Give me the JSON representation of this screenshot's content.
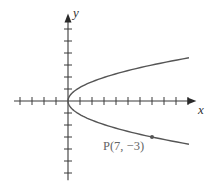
{
  "chart_data": {
    "type": "line",
    "title": "",
    "xlabel": "x",
    "ylabel": "y",
    "equation": "x = (7/9) y^2",
    "origin_px": [
      68,
      101
    ],
    "unit_px": 12,
    "xlim": [
      -4.5,
      10.7
    ],
    "ylim": [
      -6.6,
      7.3
    ],
    "x_ticks": [
      -4,
      -3,
      -2,
      -1,
      1,
      2,
      3,
      4,
      5,
      6,
      7,
      8,
      9,
      10
    ],
    "y_ticks": [
      -6,
      -5,
      -4,
      -3,
      -2,
      -1,
      1,
      2,
      3,
      4,
      5,
      6
    ],
    "grid": false,
    "legend": null,
    "series": [
      {
        "name": "parabola",
        "color": "#555555",
        "y_range": [
          -3.6,
          3.6
        ],
        "x_of_y": "7/9 * y^2"
      }
    ],
    "annotations": [
      {
        "text": "P(7, −3)",
        "point": [
          7,
          -3
        ],
        "color": "#666666"
      }
    ]
  },
  "labels": {
    "x_axis": "x",
    "y_axis": "y",
    "point": "P(7, −3)"
  }
}
